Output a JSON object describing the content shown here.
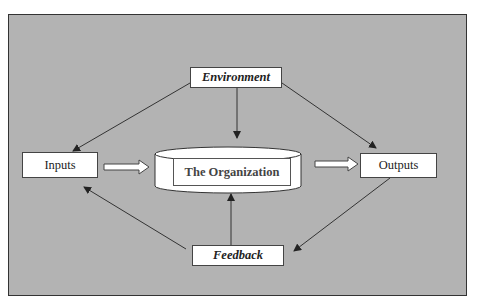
{
  "diagram": {
    "nodes": {
      "environment": "Environment",
      "inputs": "Inputs",
      "organization": "The Organization",
      "outputs": "Outputs",
      "feedback": "Feedback"
    },
    "edges": [
      {
        "from": "Environment",
        "to": "Inputs"
      },
      {
        "from": "Environment",
        "to": "The Organization"
      },
      {
        "from": "Environment",
        "to": "Outputs"
      },
      {
        "from": "Inputs",
        "to": "The Organization",
        "style": "block-arrow"
      },
      {
        "from": "The Organization",
        "to": "Outputs",
        "style": "block-arrow"
      },
      {
        "from": "Outputs",
        "to": "Feedback"
      },
      {
        "from": "Feedback",
        "to": "The Organization"
      },
      {
        "from": "Feedback",
        "to": "Inputs"
      }
    ],
    "colors": {
      "background": "#b3b3b3",
      "box_fill": "#ffffff",
      "line": "#333333"
    }
  }
}
